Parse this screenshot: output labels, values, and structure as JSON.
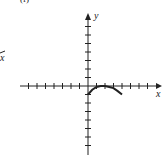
{
  "panel_label": "(f)",
  "left_fragment_label": "x",
  "chart_data": {
    "type": "line",
    "title": "",
    "xlabel": "x",
    "ylabel": "y",
    "grid": false,
    "xlim": [
      -8,
      8
    ],
    "ylim": [
      -8,
      8
    ],
    "tick_spacing": 1,
    "series": [
      {
        "name": "f(x)",
        "x": [
          0,
          0.5,
          1,
          1.5,
          2,
          2.5,
          3,
          3.5,
          4
        ],
        "y": [
          -1,
          -0.44,
          -0.11,
          0,
          0,
          -0.11,
          -0.25,
          -0.6,
          -1
        ]
      }
    ]
  }
}
